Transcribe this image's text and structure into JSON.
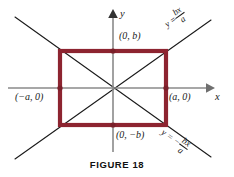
{
  "figure": {
    "caption": "FIGURE 18",
    "caption_top_px": 158,
    "colors": {
      "rectangle": "#8d2430",
      "rectangle_dark": "#6e1a24",
      "axis": "#8a8a8a",
      "asymptote": "#1a1a1a",
      "vertex_dot": "#8d2430",
      "background": "#ffffff"
    },
    "axes": {
      "x_label": "x",
      "y_label": "y",
      "origin": {
        "x": 113,
        "y": 88
      },
      "x_from": 8,
      "x_to": 212,
      "y_from": 12,
      "y_to": 152
    },
    "rectangle": {
      "left": 60,
      "right": 166,
      "top": 51,
      "bottom": 125,
      "stroke_width": 4
    },
    "vertex_labels": [
      {
        "name": "top",
        "text": "(0, b)",
        "left": 119,
        "top": 33
      },
      {
        "name": "right",
        "text": "(a, 0)",
        "left": 168,
        "top": 92
      },
      {
        "name": "bottom",
        "text": "(0, −b)",
        "left": 116,
        "top": 130
      },
      {
        "name": "left",
        "text": "(−a, 0)",
        "left": 17,
        "top": 92
      }
    ],
    "asymptotes": [
      {
        "name": "positive-slope",
        "equation_lhs": "y =",
        "equation_num": "bx",
        "equation_den": "a",
        "x1": 15,
        "y1": 159,
        "x2": 211,
        "y2": 20,
        "label_left": 170,
        "label_top": 12,
        "label_rotate": -35
      },
      {
        "name": "negative-slope",
        "equation_lhs": "y = −",
        "equation_num": "bx",
        "equation_den": "a",
        "x1": 15,
        "y1": 17,
        "x2": 211,
        "y2": 157,
        "label_left": 168,
        "label_top": 118,
        "label_rotate": 35
      }
    ],
    "vertex_dots": [
      {
        "x": 113,
        "y": 51
      },
      {
        "x": 166,
        "y": 88
      },
      {
        "x": 113,
        "y": 125
      },
      {
        "x": 60,
        "y": 88
      }
    ]
  }
}
